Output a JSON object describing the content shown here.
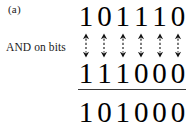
{
  "figure": {
    "panel_label": "(a)",
    "operation_label": "AND on bits",
    "colors": {
      "background": "#ffffff",
      "text": "#111111",
      "digits": "#000000",
      "rule": "#3a3a3a",
      "arrow": "#111111"
    },
    "operand_1": {
      "value": "101110",
      "bits": [
        "1",
        "0",
        "1",
        "1",
        "1",
        "0"
      ]
    },
    "operand_2": {
      "value": "111000",
      "bits": [
        "1",
        "1",
        "1",
        "0",
        "0",
        "0"
      ]
    },
    "result": {
      "value": "101000",
      "bits": [
        "1",
        "0",
        "1",
        "0",
        "0",
        "0"
      ]
    },
    "arrows": {
      "count": 6,
      "icon": "double-headed-dashed-vertical-arrow-icon",
      "items": [
        {
          "column": 1
        },
        {
          "column": 2
        },
        {
          "column": 3
        },
        {
          "column": 4
        },
        {
          "column": 5
        },
        {
          "column": 6
        }
      ]
    }
  }
}
